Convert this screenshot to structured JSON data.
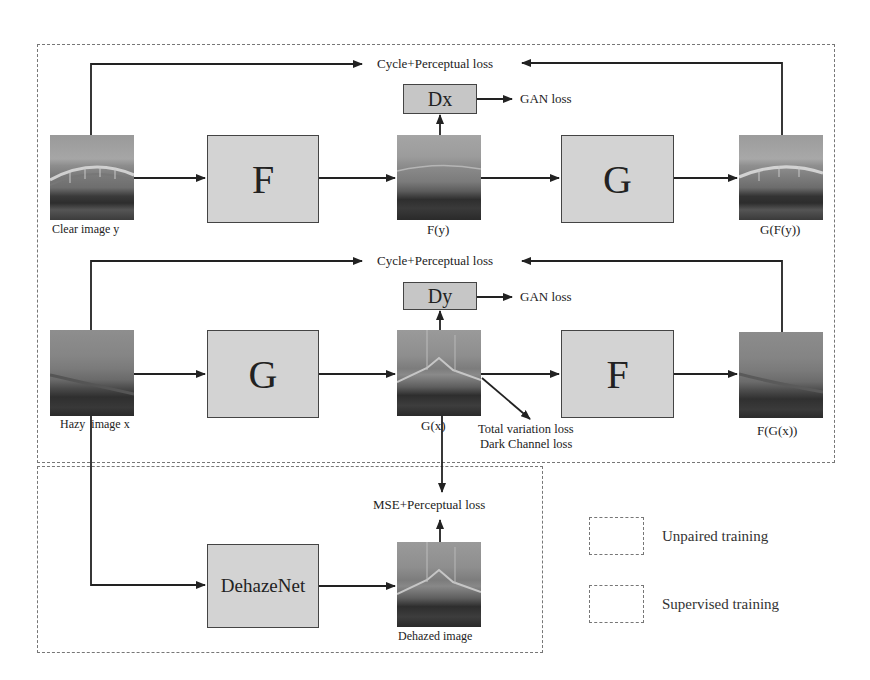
{
  "regions": {
    "unpaired": {
      "label": "Unpaired training"
    },
    "supervised": {
      "label": "Supervised training"
    }
  },
  "row1": {
    "input_label": "Clear image y",
    "generator1": "F",
    "mid_label": "F(y)",
    "discriminator": "Dx",
    "gan_loss": "GAN loss",
    "generator2": "G",
    "output_label": "G(F(y))",
    "cycle_loss": "Cycle+Perceptual loss"
  },
  "row2": {
    "input_label": "Hazy  image x",
    "generator1": "G",
    "mid_label": "G(x)",
    "discriminator": "Dy",
    "gan_loss": "GAN loss",
    "generator2": "F",
    "output_label": "F(G(x))",
    "cycle_loss": "Cycle+Perceptual loss",
    "extra_losses": [
      "Total variation loss",
      "Dark Channel loss"
    ]
  },
  "row3": {
    "network": "DehazeNet",
    "output_label": "Dehazed image",
    "loss": "MSE+Perceptual loss"
  },
  "legend": [
    {
      "label": "Unpaired training"
    },
    {
      "label": "Supervised training"
    }
  ],
  "colors": {
    "block_fill": "#d3d3d3",
    "block_border": "#444444",
    "arrow": "#222222",
    "dash": "#777777"
  }
}
